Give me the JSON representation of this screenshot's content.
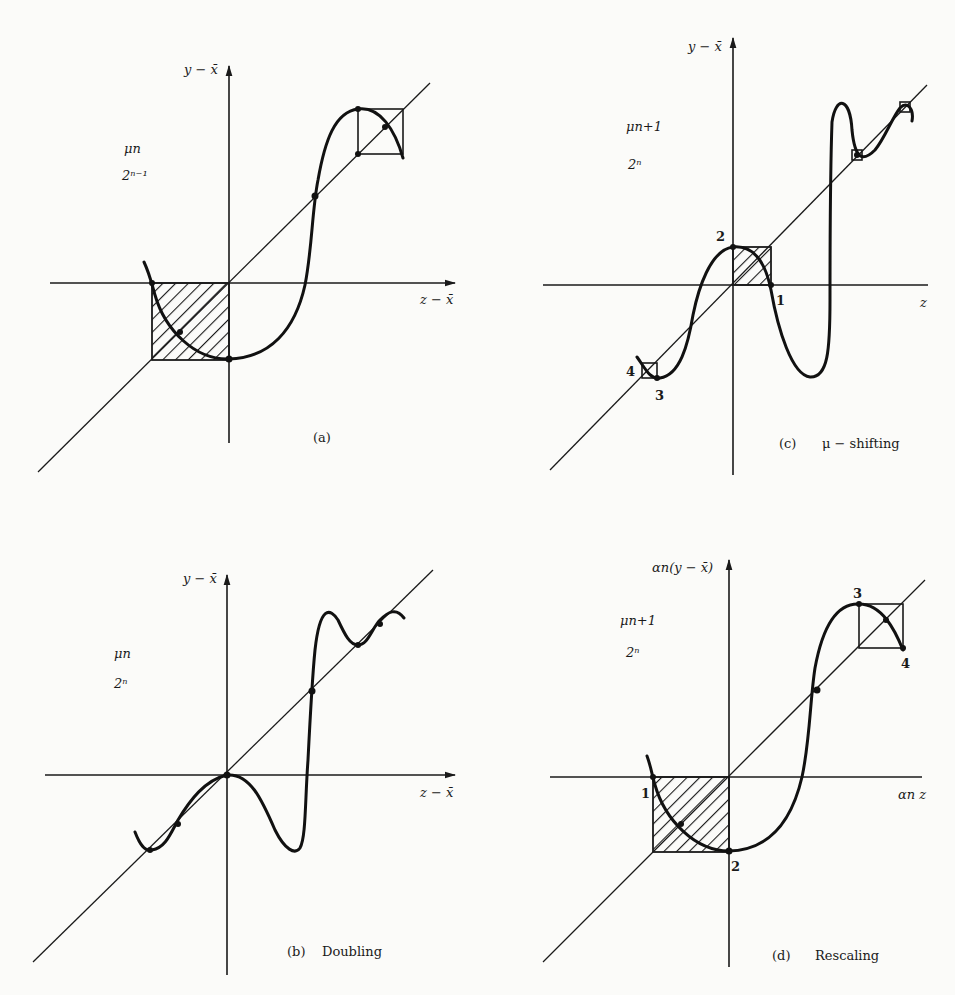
{
  "figure": {
    "panels": [
      {
        "id": "a",
        "y_axis_label": "y − x̄",
        "x_axis_label": "z − x̄",
        "param_label": "μn",
        "period_label": "2ⁿ⁻¹",
        "caption_letter": "(a)",
        "caption_text": ""
      },
      {
        "id": "c",
        "y_axis_label": "y − x̄",
        "x_axis_label": "z",
        "param_label": "μn+1",
        "period_label": "2ⁿ",
        "caption_letter": "(c)",
        "caption_text": "μ − shifting",
        "point_labels": [
          "1",
          "2",
          "3",
          "4"
        ]
      },
      {
        "id": "b",
        "y_axis_label": "y − x̄",
        "x_axis_label": "z − x̄",
        "param_label": "μn",
        "period_label": "2ⁿ",
        "caption_letter": "(b)",
        "caption_text": "Doubling"
      },
      {
        "id": "d",
        "y_axis_label": "αn(y − x̄)",
        "x_axis_label": "αn z",
        "param_label": "μn+1",
        "period_label": "2ⁿ",
        "caption_letter": "(d)",
        "caption_text": "Rescaling",
        "point_labels": [
          "1",
          "2",
          "3",
          "4"
        ]
      }
    ]
  }
}
